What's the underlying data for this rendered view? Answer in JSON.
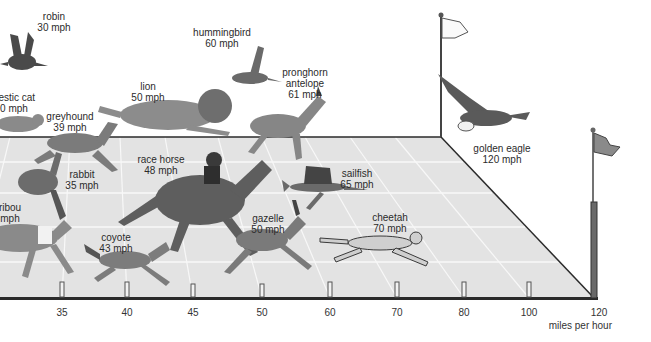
{
  "diagram": {
    "title": "",
    "axis": {
      "unit_label": "miles per hour",
      "ticks": [
        {
          "value": "35",
          "x": 62
        },
        {
          "value": "40",
          "x": 127
        },
        {
          "value": "45",
          "x": 193
        },
        {
          "value": "50",
          "x": 262
        },
        {
          "value": "60",
          "x": 330
        },
        {
          "value": "70",
          "x": 397
        },
        {
          "value": "80",
          "x": 464
        },
        {
          "value": "100",
          "x": 529
        },
        {
          "value": "120",
          "x": 595
        }
      ]
    },
    "animals": [
      {
        "name": "robin",
        "speed": "30 mph",
        "x": 52,
        "y": 12,
        "icon": "robin-icon"
      },
      {
        "name": "domestic cat",
        "speed": "30 mph",
        "x": 12,
        "y": 92,
        "icon": "cat-icon",
        "visible_name": "nestic cat",
        "visible_speed": "0 mph"
      },
      {
        "name": "greyhound",
        "speed": "39 mph",
        "x": 68,
        "y": 110,
        "icon": "greyhound-icon"
      },
      {
        "name": "lion",
        "speed": "50 mph",
        "x": 147,
        "y": 80,
        "icon": "lion-icon"
      },
      {
        "name": "hummingbird",
        "speed": "60 mph",
        "x": 223,
        "y": 27,
        "icon": "hummingbird-icon"
      },
      {
        "name": "pronghorn antelope",
        "speed": "61 mph",
        "x": 306,
        "y": 67,
        "icon": "antelope-icon",
        "visible_name_line1": "pronghorn",
        "visible_name_line2": "antelope"
      },
      {
        "name": "race horse",
        "speed": "48 mph",
        "x": 160,
        "y": 154,
        "icon": "horse-icon"
      },
      {
        "name": "rabbit",
        "speed": "35 mph",
        "x": 82,
        "y": 169,
        "icon": "rabbit-icon"
      },
      {
        "name": "caribou",
        "speed": "mph",
        "x": 9,
        "y": 202,
        "icon": "caribou-icon",
        "visible_name": "ribou"
      },
      {
        "name": "sailfish",
        "speed": "65 mph",
        "x": 356,
        "y": 168,
        "icon": "sailfish-icon"
      },
      {
        "name": "gazelle",
        "speed": "50 mph",
        "x": 268,
        "y": 213,
        "icon": "gazelle-icon"
      },
      {
        "name": "cheetah",
        "speed": "70 mph",
        "x": 390,
        "y": 212,
        "icon": "cheetah-icon"
      },
      {
        "name": "coyote",
        "speed": "43 mph",
        "x": 116,
        "y": 232,
        "icon": "coyote-icon"
      },
      {
        "name": "golden eagle",
        "speed": "120 mph",
        "x": 502,
        "y": 144,
        "icon": "eagle-icon"
      }
    ],
    "colors": {
      "track": "#e3e3e3",
      "track_lines": "#f7f7f7",
      "edge": "#2a2a2a",
      "animal_fill": "#7b7b7b",
      "animal_dark": "#4a4a4a"
    }
  }
}
